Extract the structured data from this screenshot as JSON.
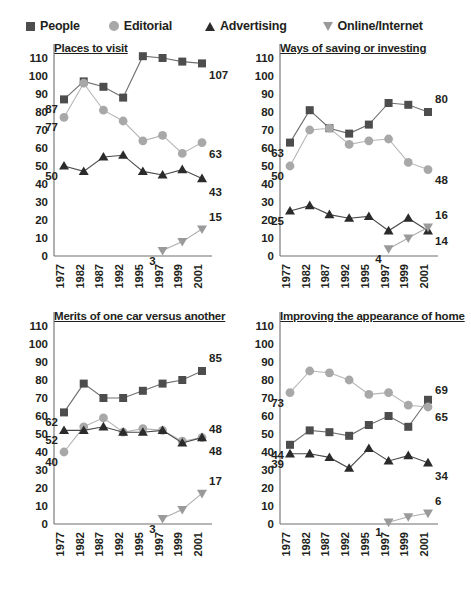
{
  "legend": {
    "items": [
      {
        "label": "People",
        "icon": "square-marker-icon",
        "color": "#4d4d4d"
      },
      {
        "label": "Editorial",
        "icon": "circle-marker-icon",
        "color": "#a8a8a8"
      },
      {
        "label": "Advertising",
        "icon": "triangle-up-marker-icon",
        "color": "#2b2b2b"
      },
      {
        "label": "Online/Internet",
        "icon": "triangle-down-marker-icon",
        "color": "#9a9a9a"
      }
    ]
  },
  "axis": {
    "yticks": [
      0,
      10,
      20,
      30,
      40,
      50,
      60,
      70,
      80,
      90,
      100,
      110
    ],
    "xticks": [
      "1977",
      "1982",
      "1987",
      "1992",
      "1995",
      "1997",
      "1999",
      "2001"
    ]
  },
  "chart_data": [
    {
      "type": "line",
      "title": "Places to visit",
      "xlabel": "",
      "ylabel": "",
      "ylim": [
        0,
        110
      ],
      "grid": false,
      "legend_position": "top",
      "categories": [
        "1977",
        "1982",
        "1987",
        "1992",
        "1995",
        "1997",
        "1999",
        "2001"
      ],
      "series": [
        {
          "name": "People",
          "values": [
            87,
            97,
            94,
            88,
            111,
            110,
            108,
            107
          ],
          "start_label": "87",
          "end_label": "107"
        },
        {
          "name": "Editorial",
          "values": [
            77,
            96,
            81,
            75,
            64,
            67,
            57,
            63
          ],
          "start_label": "77",
          "end_label": "63"
        },
        {
          "name": "Advertising",
          "values": [
            50,
            47,
            55,
            56,
            47,
            45,
            48,
            43
          ],
          "start_label": "50",
          "end_label": "43"
        },
        {
          "name": "Online/Internet",
          "values": [
            null,
            null,
            null,
            null,
            null,
            3,
            8,
            15
          ],
          "start_label": "3",
          "end_label": "15"
        }
      ]
    },
    {
      "type": "line",
      "title": "Ways of saving or investing",
      "xlabel": "",
      "ylabel": "",
      "ylim": [
        0,
        110
      ],
      "grid": false,
      "legend_position": "top",
      "categories": [
        "1977",
        "1982",
        "1987",
        "1992",
        "1995",
        "1997",
        "1999",
        "2001"
      ],
      "series": [
        {
          "name": "People",
          "values": [
            63,
            81,
            71,
            68,
            73,
            85,
            84,
            80
          ],
          "start_label": "63",
          "end_label": "80"
        },
        {
          "name": "Editorial",
          "values": [
            50,
            70,
            71,
            62,
            64,
            65,
            52,
            48
          ],
          "start_label": "50",
          "end_label": "48"
        },
        {
          "name": "Advertising",
          "values": [
            25,
            28,
            23,
            21,
            22,
            14,
            21,
            14
          ],
          "start_label": "25",
          "end_label": "14"
        },
        {
          "name": "Online/Internet",
          "values": [
            null,
            null,
            null,
            null,
            null,
            4,
            10,
            16
          ],
          "start_label": "4",
          "end_label": "16"
        }
      ]
    },
    {
      "type": "line",
      "title": "Merits of one car versus another",
      "xlabel": "",
      "ylabel": "",
      "ylim": [
        0,
        110
      ],
      "grid": false,
      "legend_position": "top",
      "categories": [
        "1977",
        "1982",
        "1987",
        "1992",
        "1995",
        "1997",
        "1999",
        "2001"
      ],
      "series": [
        {
          "name": "People",
          "values": [
            62,
            78,
            70,
            70,
            74,
            78,
            80,
            85
          ],
          "start_label": "62",
          "end_label": "85"
        },
        {
          "name": "Editorial",
          "values": [
            40,
            54,
            59,
            51,
            53,
            52,
            46,
            48
          ],
          "start_label": "40",
          "end_label": "48"
        },
        {
          "name": "Advertising",
          "values": [
            52,
            52,
            54,
            51,
            51,
            52,
            45,
            48
          ],
          "start_label": "52",
          "end_label": "48"
        },
        {
          "name": "Online/Internet",
          "values": [
            null,
            null,
            null,
            null,
            null,
            3,
            8,
            17
          ],
          "start_label": "3",
          "end_label": "17"
        }
      ]
    },
    {
      "type": "line",
      "title": "Improving the appearance of home",
      "xlabel": "",
      "ylabel": "",
      "ylim": [
        0,
        110
      ],
      "grid": false,
      "legend_position": "top",
      "categories": [
        "1977",
        "1982",
        "1987",
        "1992",
        "1995",
        "1997",
        "1999",
        "2001"
      ],
      "series": [
        {
          "name": "People",
          "values": [
            44,
            52,
            51,
            49,
            55,
            60,
            54,
            69
          ],
          "start_label": "44",
          "end_label": "69"
        },
        {
          "name": "Editorial",
          "values": [
            73,
            85,
            84,
            80,
            72,
            73,
            66,
            65
          ],
          "start_label": "73",
          "end_label": "65"
        },
        {
          "name": "Advertising",
          "values": [
            39,
            39,
            37,
            31,
            42,
            35,
            38,
            34
          ],
          "start_label": "39",
          "end_label": "34"
        },
        {
          "name": "Online/Internet",
          "values": [
            null,
            null,
            null,
            null,
            null,
            1,
            4,
            6
          ],
          "start_label": "1",
          "end_label": "6"
        }
      ]
    }
  ]
}
